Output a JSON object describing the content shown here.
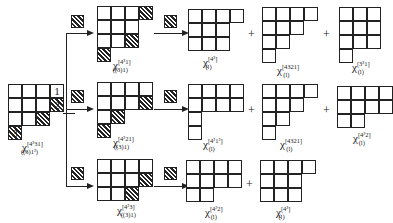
{
  "source": {
    "cell_labels": [
      "1",
      "2",
      "3"
    ],
    "caption": {
      "symbol": "χ",
      "sup": "[4³31]",
      "sub": "((3)1²)"
    }
  },
  "rows": [
    {
      "intermediate": {
        "symbol": "χ",
        "sup": "[4³1]",
        "sub": "((3)1)"
      },
      "results": [
        {
          "symbol": "χ",
          "sup": "[4³]",
          "sub": "(l)"
        },
        {
          "symbol": "χ",
          "sup": "[4321]",
          "sub": "(l)"
        },
        {
          "symbol": "χ",
          "sup": "[3³1]",
          "sub": "(l)"
        }
      ]
    },
    {
      "intermediate": {
        "symbol": "χ",
        "sup": "[4²21]",
        "sub": "((3)1)"
      },
      "results": [
        {
          "symbol": "χ",
          "sup": "[4²1²]",
          "sub": "(l)"
        },
        {
          "symbol": "χ",
          "sup": "[4321]",
          "sub": "(l)"
        },
        {
          "symbol": "χ",
          "sup": "[4²2]",
          "sub": "(l)"
        }
      ]
    },
    {
      "intermediate": {
        "symbol": "χ",
        "sup": "[4²3]",
        "sub": "((3)1)"
      },
      "results": [
        {
          "symbol": "χ",
          "sup": "[4²2]",
          "sub": "(l)"
        },
        {
          "symbol": "χ",
          "sup": "[4³]",
          "sub": "(l)"
        }
      ]
    }
  ],
  "operators": {
    "plus": "+"
  }
}
